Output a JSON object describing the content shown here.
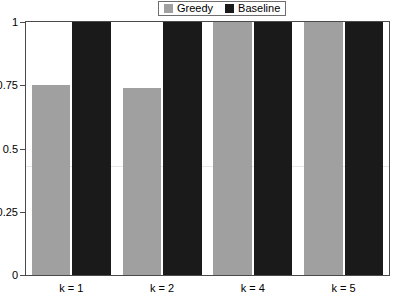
{
  "chart_data": {
    "type": "bar",
    "title": "",
    "subtitle": "",
    "xlabel": "",
    "ylabel": "",
    "categories": [
      "k = 1",
      "k = 2",
      "k = 4",
      "k = 5"
    ],
    "series": [
      {
        "name": "Greedy",
        "color": "#a0a0a0",
        "values": [
          0.75,
          0.74,
          1.0,
          1.0
        ]
      },
      {
        "name": "Baseline",
        "color": "#1a1a1a",
        "values": [
          1.0,
          1.0,
          1.0,
          1.0
        ]
      }
    ],
    "ylim": [
      0,
      1
    ],
    "yticks": [
      "0",
      "0.25",
      "0.5",
      "0.75",
      "1"
    ],
    "ytick_values": [
      0,
      0.25,
      0.5,
      0.75,
      1
    ],
    "grid": false,
    "legend_position": "top-center"
  },
  "legend": {
    "entries": [
      {
        "label": "Greedy",
        "swatch_color": "#a0a0a0",
        "icon": "legend-swatch-greedy"
      },
      {
        "label": "Baseline",
        "swatch_color": "#1a1a1a",
        "icon": "legend-swatch-baseline"
      }
    ]
  },
  "colors": {
    "greedy": "#a0a0a0",
    "baseline": "#1a1a1a",
    "axis": "#4a4a4a",
    "legend_border": "#6e6e6e",
    "background": "#ffffff",
    "rule": "#e8e8e8"
  }
}
